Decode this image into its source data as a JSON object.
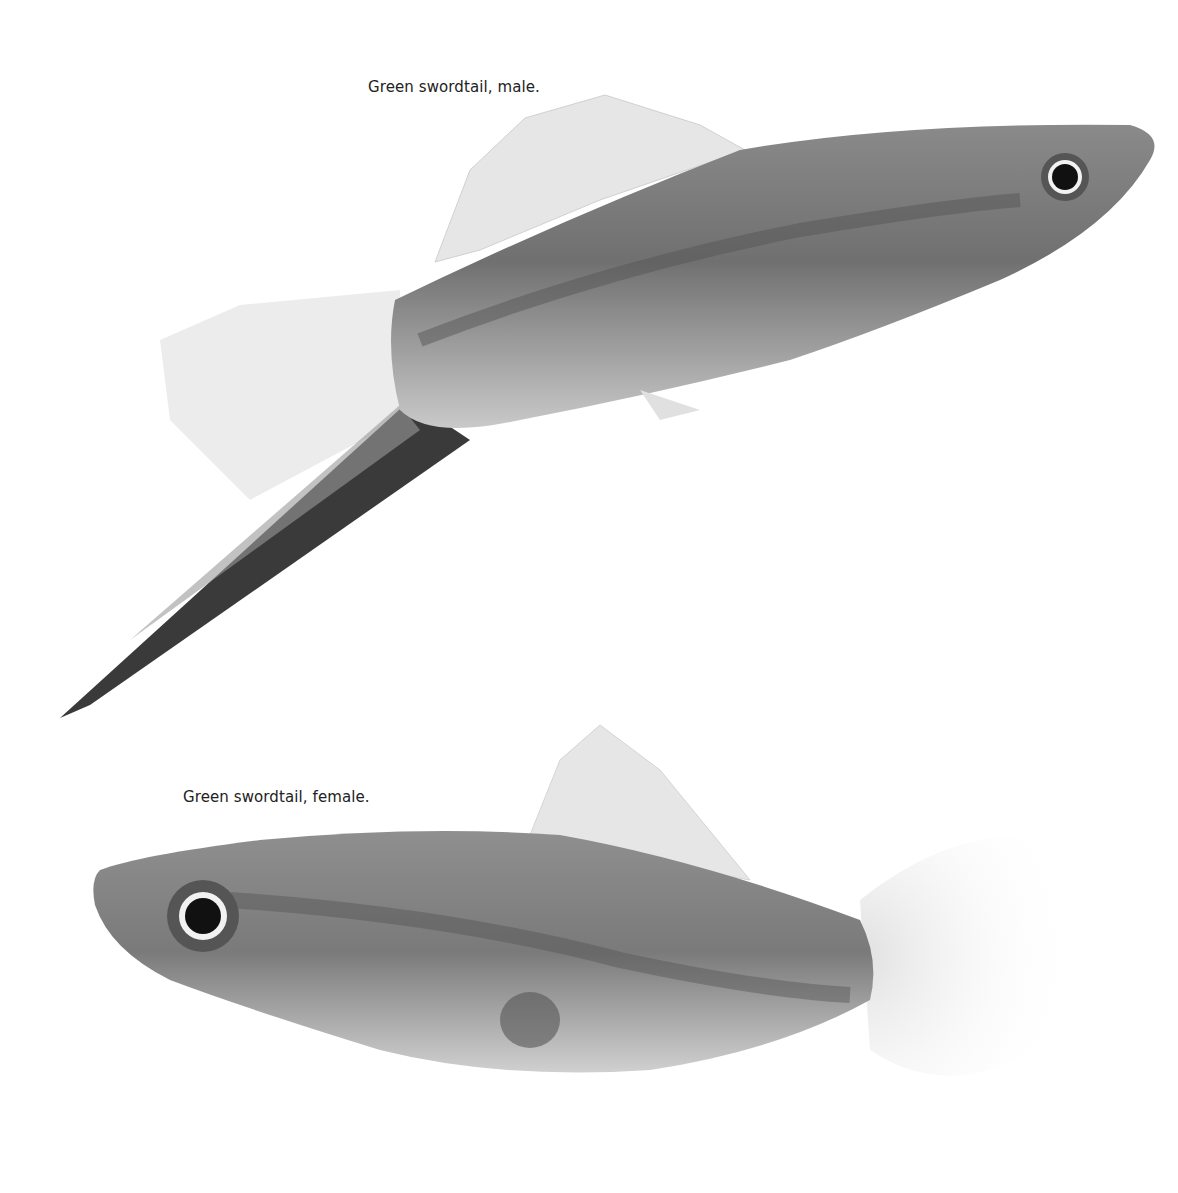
{
  "figures": [
    {
      "caption": "Green swordtail, male.",
      "subject": "male green swordtail fish, facing right, with long sword-like lower tail extension"
    },
    {
      "caption": "Green swordtail, female.",
      "subject": "female green swordtail fish, facing left, with rounded fan tail"
    }
  ],
  "colors": {
    "background": "#ffffff",
    "body_dark": "#6e6e6e",
    "body_mid": "#9a9a9a",
    "fin_light": "#d8d8d8",
    "eye": "#111111"
  }
}
